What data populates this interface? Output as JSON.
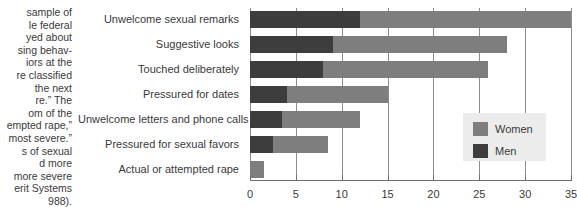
{
  "caption": {
    "text": "sample of\nle federal\nyed about\nsing behav-\niors at the\nre classified\nthe next\nre.” The\nom of the\nempted rape,”\nmost severe.”\ns of sexual\nd more\nmore severe\nerit Systems\n988)."
  },
  "legend": {
    "position": "inside-right",
    "items": [
      {
        "label": "Women",
        "color": "#7e7e7e"
      },
      {
        "label": "Men",
        "color": "#3d3d3d"
      }
    ]
  },
  "chart_data": {
    "type": "bar",
    "orientation": "horizontal",
    "stacked": true,
    "title": "",
    "xlabel": "",
    "ylabel": "",
    "xlim": [
      0,
      35
    ],
    "xticks": [
      0,
      5,
      10,
      15,
      20,
      25,
      30,
      35
    ],
    "xtick_labels": [
      "0",
      "5",
      "10",
      "15",
      "20",
      "25",
      "30",
      "35"
    ],
    "grid": true,
    "grid_axis": "x",
    "categories": [
      "Unwelcome sexual remarks",
      "Suggestive looks",
      "Touched deliberately",
      "Pressured for dates",
      "Unwelcome letters and phone calls",
      "Pressured for sexual favors",
      "Actual or attempted rape"
    ],
    "series": [
      {
        "name": "Men",
        "color": "#3d3d3d",
        "values": [
          12,
          9,
          8,
          4,
          3.5,
          2.5,
          0
        ]
      },
      {
        "name": "Women",
        "color": "#7e7e7e",
        "values": [
          23,
          19,
          18,
          11,
          8.5,
          6,
          1.5
        ]
      }
    ],
    "totals": [
      35,
      28,
      26,
      15,
      12,
      8.5,
      1.5
    ]
  }
}
